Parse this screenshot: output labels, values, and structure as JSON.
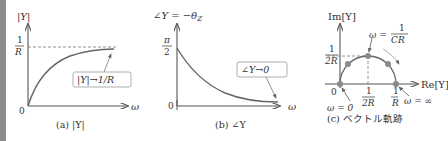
{
  "panels": [
    {
      "id": "a",
      "caption": "(a) |Y|",
      "y_axis_label": "|Y|",
      "x_axis_label": "ω",
      "origin_label": "0",
      "y_tick_num": "1",
      "y_tick_den": "R",
      "annotation": "|Y|→1/R"
    },
    {
      "id": "b",
      "caption": "(b) ∠Y",
      "y_axis_label": "∠Y = −θ",
      "y_axis_sub": "Z",
      "x_axis_label": "ω",
      "origin_label": "0",
      "y_tick_num": "π",
      "y_tick_den": "2",
      "annotation": "∠Y→0"
    },
    {
      "id": "c",
      "caption": "(c) ベクトル軌跡",
      "y_axis_label": "Im[Y]",
      "x_axis_label": "Re[Y]",
      "origin_label": "0",
      "y_tick_num": "1",
      "y_tick_den": "2R",
      "x_tick1_num": "1",
      "x_tick1_den": "2R",
      "x_tick2_num": "1",
      "x_tick2_den": "R",
      "label_omega_zero": "ω = 0",
      "label_omega_inf": "ω = ∞",
      "label_omega_peak_prefix": "ω =",
      "label_omega_peak_num": "1",
      "label_omega_peak_den": "CR"
    }
  ],
  "colors": {
    "curve": "#666666",
    "axis": "#555555",
    "text": "#333333",
    "dot": "#8a8a8a",
    "edge_bar": "#8c8c8c"
  }
}
